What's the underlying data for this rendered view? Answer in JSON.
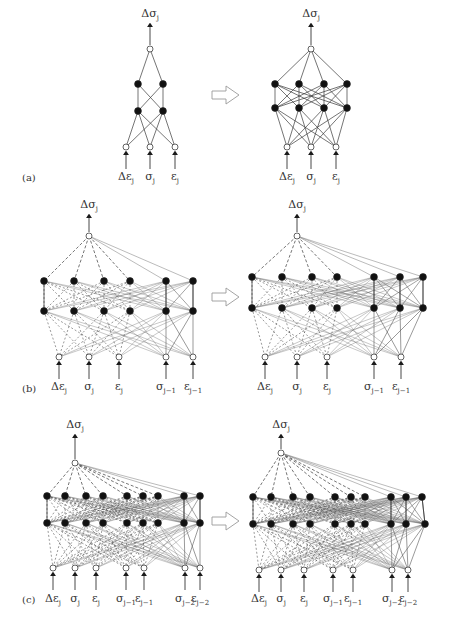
{
  "figure": {
    "header_fragment": "...complexity of the Neural Network Approach",
    "arrow_glyph": "right-hollow-arrow",
    "colors": {
      "line": "#3a3a3a",
      "node_fill": "#111111",
      "io_node_fill": "#ffffff",
      "dashed": "#555555",
      "arrow_outline": "#9a9a9a"
    }
  },
  "panels": [
    {
      "id": "a",
      "label": "(a)",
      "label_pos": [
        22,
        172
      ],
      "arrow": {
        "x": 212,
        "y": 95
      },
      "networks": [
        {
          "name": "a-before",
          "output": {
            "label": "Δσ",
            "sub": "j",
            "x": 150,
            "y": 49,
            "label_y": 8
          },
          "hidden": [
            {
              "y": 84,
              "x": [
                138,
                163
              ]
            },
            {
              "y": 111,
              "x": [
                138,
                163
              ]
            }
          ],
          "inputs": {
            "y": 147,
            "x": [
              126,
              150,
              175
            ]
          },
          "input_labels": [
            {
              "t": "Δε",
              "s": "j"
            },
            {
              "t": "σ",
              "s": "j"
            },
            {
              "t": "ε",
              "s": "j"
            }
          ],
          "label_y": 171,
          "history_cols": 0
        },
        {
          "name": "a-after",
          "output": {
            "label": "Δσ",
            "sub": "j",
            "x": 311,
            "y": 49,
            "label_y": 8
          },
          "hidden": [
            {
              "y": 84,
              "x": [
                275,
                299,
                324,
                347
              ]
            },
            {
              "y": 108,
              "x": [
                275,
                299,
                324,
                347
              ]
            }
          ],
          "inputs": {
            "y": 147,
            "x": [
              287,
              311,
              336
            ]
          },
          "input_labels": [
            {
              "t": "Δε",
              "s": "j"
            },
            {
              "t": "σ",
              "s": "j"
            },
            {
              "t": "ε",
              "s": "j"
            }
          ],
          "label_y": 171,
          "history_cols": 0
        }
      ]
    },
    {
      "id": "b",
      "label": "(b)",
      "label_pos": [
        22,
        383
      ],
      "arrow": {
        "x": 212,
        "y": 297
      },
      "networks": [
        {
          "name": "b-before",
          "output": {
            "label": "Δσ",
            "sub": "j",
            "x": 89,
            "y": 236,
            "label_y": 199
          },
          "hidden": [
            {
              "y": 281,
              "x": [
                44,
                74,
                104,
                130,
                166,
                193
              ]
            },
            {
              "y": 311,
              "x": [
                44,
                74,
                104,
                130,
                166,
                193
              ]
            }
          ],
          "inputs": {
            "y": 357,
            "x": [
              59,
              89,
              119,
              166,
              193
            ]
          },
          "input_labels": [
            {
              "t": "Δε",
              "s": "j"
            },
            {
              "t": "σ",
              "s": "j"
            },
            {
              "t": "ε",
              "s": "j"
            },
            {
              "t": "σ",
              "s": "j−1"
            },
            {
              "t": "ε",
              "s": "j−1"
            }
          ],
          "label_y": 381,
          "history_cols": 2
        },
        {
          "name": "b-after",
          "output": {
            "label": "Δσ",
            "sub": "j",
            "x": 297,
            "y": 236,
            "label_y": 199
          },
          "hidden": [
            {
              "y": 277,
              "x": [
                252,
                282,
                312,
                337,
                374,
                400,
                423
              ]
            },
            {
              "y": 308,
              "x": [
                252,
                282,
                312,
                337,
                374,
                400,
                423
              ]
            }
          ],
          "inputs": {
            "y": 357,
            "x": [
              265,
              297,
              327,
              374,
              401
            ]
          },
          "input_labels": [
            {
              "t": "Δε",
              "s": "j"
            },
            {
              "t": "σ",
              "s": "j"
            },
            {
              "t": "ε",
              "s": "j"
            },
            {
              "t": "σ",
              "s": "j−1"
            },
            {
              "t": "ε",
              "s": "j−1"
            }
          ],
          "label_y": 381,
          "history_cols": 3
        }
      ]
    },
    {
      "id": "c",
      "label": "(c)",
      "label_pos": [
        22,
        594
      ],
      "arrow": {
        "x": 212,
        "y": 521
      },
      "networks": [
        {
          "name": "c-before",
          "output": {
            "label": "Δσ",
            "sub": "j",
            "x": 75,
            "y": 463,
            "label_y": 419
          },
          "hidden": [
            {
              "y": 496,
              "x": [
                47,
                65,
                86,
                103,
                127,
                143,
                158,
                184,
                200
              ]
            },
            {
              "y": 523,
              "x": [
                47,
                65,
                86,
                103,
                127,
                143,
                158,
                184,
                200
              ]
            }
          ],
          "inputs": {
            "y": 568,
            "x": [
              53,
              75,
              96,
              126,
              144,
              185,
              200
            ]
          },
          "input_labels": [
            {
              "t": "Δε",
              "s": "j"
            },
            {
              "t": "σ",
              "s": "j"
            },
            {
              "t": "ε",
              "s": "j"
            },
            {
              "t": "σ",
              "s": "j−1"
            },
            {
              "t": "ε",
              "s": "j−1"
            },
            {
              "t": "σ",
              "s": "j−2"
            },
            {
              "t": "ε",
              "s": "j−2"
            }
          ],
          "label_y": 593,
          "history_cols": 2
        },
        {
          "name": "c-after",
          "output": {
            "label": "Δσ",
            "sub": "j",
            "x": 281,
            "y": 453,
            "label_y": 419
          },
          "hidden": [
            {
              "y": 497,
              "x": [
                253,
                271,
                293,
                310,
                335,
                351,
                365,
                391,
                406,
                422
              ]
            },
            {
              "y": 524,
              "x": [
                253,
                271,
                293,
                310,
                335,
                351,
                365,
                391,
                406,
                425
              ]
            }
          ],
          "inputs": {
            "y": 570,
            "x": [
              259,
              281,
              304,
              333,
              353,
              392,
              408
            ]
          },
          "input_labels": [
            {
              "t": "Δε",
              "s": "j"
            },
            {
              "t": "σ",
              "s": "j"
            },
            {
              "t": "ε",
              "s": "j"
            },
            {
              "t": "σ",
              "s": "j−1"
            },
            {
              "t": "ε",
              "s": "j−1"
            },
            {
              "t": "σ",
              "s": "j−2"
            },
            {
              "t": "ε",
              "s": "j−2"
            }
          ],
          "label_y": 593,
          "history_cols": 3
        }
      ]
    }
  ]
}
